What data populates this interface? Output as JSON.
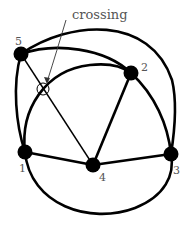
{
  "annotation": {
    "text": "crossing"
  },
  "nodes": [
    {
      "id": "1",
      "label": "1"
    },
    {
      "id": "2",
      "label": "2"
    },
    {
      "id": "3",
      "label": "3"
    },
    {
      "id": "4",
      "label": "4"
    },
    {
      "id": "5",
      "label": "5"
    }
  ],
  "edges": [
    "5-4",
    "2-4",
    "1-4",
    "4-3",
    "5-2",
    "5-3",
    "1-2",
    "1-3",
    "5-1"
  ]
}
